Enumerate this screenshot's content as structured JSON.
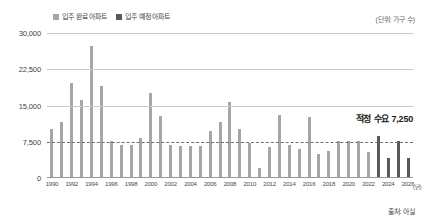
{
  "legend": {
    "items": [
      {
        "label": "입주 완료 아파트",
        "color": "#a6a6a6",
        "icon": "square-swatch"
      },
      {
        "label": "입주 예정 아파트",
        "color": "#595959",
        "icon": "square-swatch"
      }
    ]
  },
  "unit_note": "(단위: 가구 수)",
  "annotation": "적정 수요 7,250",
  "source": "출처: 아실",
  "x_unit_suffix": "(년)",
  "colors": {
    "completed_bar": "#a6a6a6",
    "planned_bar": "#595959",
    "gridline": "#c9c9c9",
    "reference_line": "#6f6f6f",
    "axis_text": "#3f3f3f"
  },
  "chart_data": {
    "type": "bar",
    "title": "",
    "subtitle": "",
    "xlabel": "(년)",
    "ylabel": "(단위: 가구 수)",
    "ylim": [
      0,
      30000
    ],
    "yticks": [
      0,
      7500,
      15000,
      22500,
      30000
    ],
    "ytick_labels": [
      "0",
      "7,500",
      "15,000",
      "22,500",
      "30,000"
    ],
    "grid": true,
    "gridlines_at": [
      15000,
      22500,
      30000
    ],
    "reference_line": {
      "value": 7250,
      "label": "적정 수요 7,250",
      "style": "dashed"
    },
    "legend_position": "top-left",
    "xtick_labels": [
      "1990",
      "1992",
      "1994",
      "1996",
      "1998",
      "2000",
      "2002",
      "2004",
      "2006",
      "2008",
      "2010",
      "2012",
      "2014",
      "2016",
      "2018",
      "2020",
      "2022",
      "2024",
      "2026"
    ],
    "categories": [
      "1990",
      "1991",
      "1992",
      "1993",
      "1994",
      "1995",
      "1996",
      "1997",
      "1998",
      "1999",
      "2000",
      "2001",
      "2002",
      "2003",
      "2004",
      "2005",
      "2006",
      "2007",
      "2008",
      "2009",
      "2010",
      "2011",
      "2012",
      "2013",
      "2014",
      "2015",
      "2016",
      "2017",
      "2018",
      "2019",
      "2020",
      "2021",
      "2022",
      "2023",
      "2024",
      "2025",
      "2026"
    ],
    "series": [
      {
        "name": "입주 완료 아파트",
        "color": "#a6a6a6",
        "values": [
          9900,
          11400,
          19400,
          16000,
          27200,
          18800,
          7500,
          6600,
          6600,
          8100,
          17300,
          12700,
          6700,
          6400,
          6400,
          6400,
          9600,
          11300,
          15500,
          9900,
          7000,
          1900,
          6300,
          12900,
          6600,
          5700,
          12400,
          4800,
          5400,
          7400,
          7500,
          7500,
          5200,
          null,
          null,
          null,
          null
        ]
      },
      {
        "name": "입주 예정 아파트",
        "color": "#595959",
        "values": [
          null,
          null,
          null,
          null,
          null,
          null,
          null,
          null,
          null,
          null,
          null,
          null,
          null,
          null,
          null,
          null,
          null,
          null,
          null,
          null,
          null,
          null,
          null,
          null,
          null,
          null,
          null,
          null,
          null,
          null,
          null,
          null,
          null,
          8500,
          4000,
          7500,
          4000
        ]
      }
    ]
  }
}
